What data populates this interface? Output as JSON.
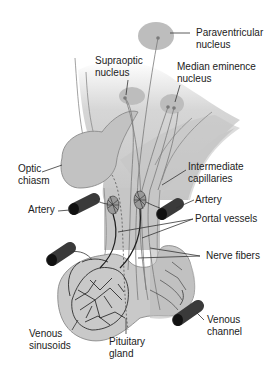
{
  "diagram": {
    "colors": {
      "tissue": "#c9c9c9",
      "tissue_dark": "#b3b3b3",
      "outline": "#8a8a8a",
      "vessel": "#3a3a3a",
      "nucleus": "#bdbdbd",
      "nucleus_dot": "#7a7a7a",
      "leader": "#333333",
      "text": "#222222"
    },
    "labels": {
      "paraventricular": [
        "Paraventricular",
        "nucleus"
      ],
      "supraoptic": [
        "Supraoptic",
        "nucleus"
      ],
      "median_eminence": [
        "Median eminence",
        "nucleus"
      ],
      "optic_chiasm": [
        "Optic",
        "chiasm"
      ],
      "intermediate_capillaries": [
        "Intermediate",
        "capillaries"
      ],
      "artery_left": "Artery",
      "artery_right": "Artery",
      "portal_vessels": "Portal vessels",
      "nerve_fibers": "Nerve fibers",
      "venous_sinusoids": [
        "Venous",
        "sinusoids"
      ],
      "pituitary_gland": [
        "Pituitary",
        "gland"
      ],
      "venous_channel": [
        "Venous",
        "channel"
      ]
    }
  }
}
